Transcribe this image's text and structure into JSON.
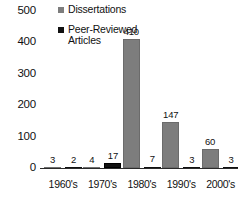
{
  "chart_data": {
    "type": "bar",
    "title": "",
    "xlabel": "",
    "ylabel": "",
    "ylim": [
      0,
      500
    ],
    "yticks": [
      0,
      100,
      200,
      300,
      400,
      500
    ],
    "grid": false,
    "legend_position": "top-left",
    "categories": [
      "1960's",
      "1970's",
      "1980's",
      "1990's",
      "2000's"
    ],
    "series": [
      {
        "name": "Dissertations",
        "color": "#7d7d7d",
        "values": [
          3,
          4,
          410,
          147,
          60
        ]
      },
      {
        "name": "Peer-Reviewed Articles",
        "color": "#111111",
        "values": [
          2,
          17,
          7,
          3,
          3
        ]
      }
    ]
  },
  "legend": {
    "items": [
      {
        "label": "Dissertations",
        "swatch": "dissertations-swatch"
      },
      {
        "label": "Peer-Reviewed Articles",
        "swatch": "articles-swatch"
      }
    ]
  },
  "axis": {
    "y_ticks": [
      "500",
      "400",
      "300",
      "200",
      "100",
      "0"
    ]
  }
}
